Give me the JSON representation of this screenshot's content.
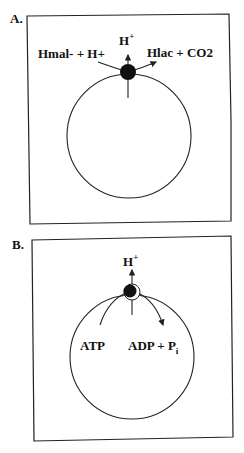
{
  "panels": [
    {
      "label": "A.",
      "membrane": "vesicle",
      "transporter": "malolactic-enzyme-carrier",
      "labels": {
        "substrate": "Hmal- + H+",
        "proton_base": "H",
        "proton_sup": "+",
        "product": "Hlac + CO2"
      }
    },
    {
      "label": "B.",
      "membrane": "vesicle",
      "transporter": "atpase",
      "labels": {
        "proton_base": "H",
        "proton_sup": "+",
        "substrate": "ATP",
        "product_base": "ADP + P",
        "product_sub": "i"
      }
    }
  ],
  "colors": {
    "stroke": "#222222",
    "fill_dot": "#111111",
    "background": "#ffffff"
  }
}
